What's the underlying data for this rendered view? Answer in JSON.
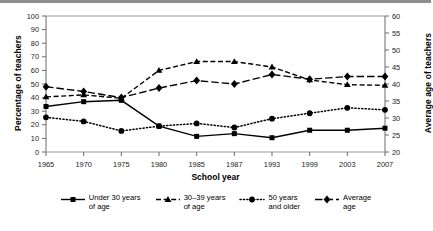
{
  "chart_data": {
    "type": "line",
    "title": "",
    "xlabel": "School year",
    "ylabel": "Percentage of teachers",
    "ylabel_right": "Average age of teachers",
    "categories": [
      "1965",
      "1970",
      "1975",
      "1980",
      "1985",
      "1987",
      "1993",
      "1999",
      "2003",
      "2007"
    ],
    "ylim": [
      0,
      100
    ],
    "yticks": [
      "0",
      "10",
      "20",
      "30",
      "40",
      "50",
      "60",
      "70",
      "80",
      "90",
      "100"
    ],
    "ylim_right": [
      20,
      60
    ],
    "yticks_right": [
      "20",
      "25",
      "30",
      "35",
      "40",
      "45",
      "50",
      "55",
      "60"
    ],
    "grid": false,
    "legend_position": "bottom",
    "series": [
      {
        "name": "Under 30 years\nof age",
        "axis": "left",
        "marker": "square",
        "line_style": "solid",
        "values": [
          33.5,
          37.0,
          38.0,
          19.0,
          11.5,
          13.5,
          10.5,
          16.0,
          16.0,
          17.5
        ]
      },
      {
        "name": "30–39  years\nof age",
        "axis": "left",
        "marker": "triangle",
        "line_style": "dashed",
        "values": [
          40.5,
          42.0,
          39.5,
          60.0,
          66.5,
          66.5,
          62.5,
          53.0,
          49.5,
          49.0
        ]
      },
      {
        "name": "50 years\nand older",
        "axis": "left",
        "marker": "circle",
        "line_style": "dotted",
        "values": [
          25.5,
          22.5,
          15.5,
          19.0,
          21.0,
          18.0,
          24.5,
          28.5,
          32.5,
          31.0
        ]
      },
      {
        "name": "Average\nage",
        "axis": "left",
        "marker": "diamond",
        "line_style": "longdash",
        "values": [
          48.0,
          44.5,
          40.0,
          47.0,
          52.5,
          50.0,
          57.0,
          53.5,
          55.5,
          55.5
        ]
      }
    ]
  }
}
